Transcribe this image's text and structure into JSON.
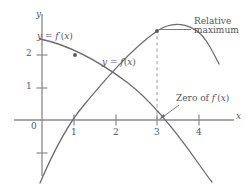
{
  "figure": {
    "type": "cartesian-plot",
    "stroke_color": "#6b6b70",
    "axis_color": "#8a8a8f",
    "dashed_color": "#9a9aa0",
    "text_color": "#555459"
  },
  "axes": {
    "x_axis_label": "x",
    "y_axis_label": "y",
    "x_ticks": [
      {
        "value": "1",
        "px": 74
      },
      {
        "value": "2",
        "px": 116
      },
      {
        "value": "3",
        "px": 157
      },
      {
        "value": "4",
        "px": 199
      }
    ],
    "y_ticks": [
      {
        "value": "2",
        "px": 55
      },
      {
        "value": "1",
        "px": 88
      }
    ],
    "origin_label": "0",
    "xlim": [
      -0.55,
      4.9
    ],
    "ylim": [
      -1.8,
      3.3
    ],
    "grid": false
  },
  "curves": [
    {
      "name": "f-prime-curve",
      "label": "y = f′(x)",
      "label_html": "<i class=\"v\">y</i> = <i class=\"v\">f</i>′(<i class=\"v\">x</i>)",
      "kind": "derivative",
      "zero_at_x": 3,
      "points": [
        [
          -0.05,
          2.45
        ],
        [
          0.5,
          2.28
        ],
        [
          1,
          2.0
        ],
        [
          1.5,
          1.62
        ],
        [
          2,
          1.2
        ],
        [
          2.5,
          0.68
        ],
        [
          3,
          0.0
        ],
        [
          3.5,
          -0.75
        ],
        [
          4,
          -1.6
        ],
        [
          4.35,
          -2.3
        ]
      ]
    },
    {
      "name": "f-curve",
      "label": "y = f(x)",
      "label_html": "<i class=\"v\">y</i> = <i class=\"v\">f</i>(<i class=\"v\">x</i>)",
      "kind": "function",
      "maximum_at": [
        3,
        2.72
      ],
      "x_intercept": 0.78,
      "points": [
        [
          -0.05,
          -1.9
        ],
        [
          0.3,
          -0.85
        ],
        [
          0.78,
          0.0
        ],
        [
          1,
          0.38
        ],
        [
          1.5,
          1.2
        ],
        [
          2,
          1.9
        ],
        [
          2.5,
          2.45
        ],
        [
          3,
          2.72
        ],
        [
          3.5,
          2.6
        ],
        [
          4,
          2.2
        ],
        [
          4.35,
          1.75
        ]
      ]
    }
  ],
  "markers": [
    {
      "name": "point-on-derivative",
      "at": [
        1,
        2
      ]
    },
    {
      "name": "point-at-maximum",
      "at": [
        3,
        2.72
      ]
    }
  ],
  "annotations": [
    {
      "name": "relative-maximum",
      "lines": [
        "Relative",
        "maximum"
      ],
      "leader": "line",
      "points_to": [
        3,
        2.72
      ]
    },
    {
      "name": "zero-of-f-prime",
      "text": "Zero of f′(x)",
      "text_html": "Zero of <i class=\"v\">f</i>′(<i class=\"v\">x</i>)",
      "leader": "arrow",
      "points_to": [
        3,
        0
      ]
    }
  ],
  "dashed_guide": {
    "name": "vertical-dashed-line",
    "from": [
      3,
      0
    ],
    "to": [
      3,
      2.72
    ]
  }
}
